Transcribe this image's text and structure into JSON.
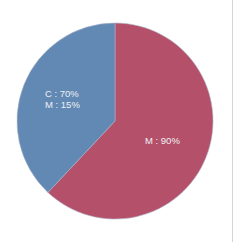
{
  "chart_data": {
    "type": "pie",
    "title": "",
    "start_angle": "12 o'clock",
    "direction": "clockwise",
    "slices": [
      {
        "name": "red-slice",
        "label_lines": [
          "M : 90%"
        ],
        "share": 0.62,
        "color": "#b5506a"
      },
      {
        "name": "blue-slice",
        "label_lines": [
          "C : 70%",
          "M : 15%"
        ],
        "share": 0.38,
        "color": "#6288b4"
      }
    ],
    "legend": "none",
    "grid": false
  },
  "labels": {
    "red": {
      "line1": "M : 90%"
    },
    "blue": {
      "line1": "C : 70%",
      "line2": "M : 15%"
    }
  }
}
